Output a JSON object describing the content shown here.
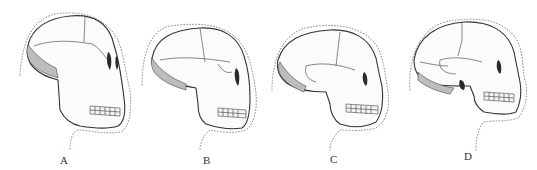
{
  "figure": {
    "panels": [
      {
        "id": "A",
        "label": "A"
      },
      {
        "id": "B",
        "label": "B"
      },
      {
        "id": "C",
        "label": "C"
      },
      {
        "id": "D",
        "label": "D"
      }
    ],
    "colors": {
      "ink": "#333333",
      "background": "#ffffff",
      "outline_dots": "#777777"
    }
  }
}
